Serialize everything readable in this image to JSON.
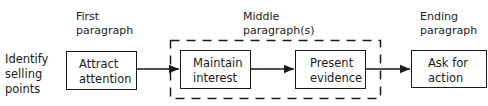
{
  "diagram": {
    "left_label": "Identify\nselling\npoints",
    "stages": [
      {
        "heading": "First\nparagraph",
        "steps": [
          "Attract\nattention"
        ]
      },
      {
        "heading": "Middle\nparagraph(s)",
        "steps": [
          "Maintain\ninterest",
          "Present\nevidence"
        ]
      },
      {
        "heading": "Ending\nparagraph",
        "steps": [
          "Ask for\naction"
        ]
      }
    ]
  }
}
